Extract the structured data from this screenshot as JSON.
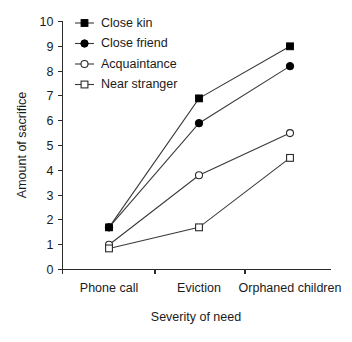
{
  "chart_data": {
    "type": "line",
    "title": "",
    "xlabel": "Severity of need",
    "ylabel": "Amount of sacrifice",
    "categories": [
      "Phone call",
      "Eviction",
      "Orphaned children"
    ],
    "ylim": [
      0,
      10
    ],
    "yticks": [
      0,
      1,
      2,
      3,
      4,
      5,
      6,
      7,
      8,
      9,
      10
    ],
    "grid": false,
    "legend_position": "top-left",
    "series": [
      {
        "name": "Close kin",
        "marker": "filled-square",
        "color": "#000000",
        "values": [
          1.7,
          6.9,
          9.0
        ]
      },
      {
        "name": "Close friend",
        "marker": "filled-circle",
        "color": "#000000",
        "values": [
          1.7,
          5.9,
          8.2
        ]
      },
      {
        "name": "Acquaintance",
        "marker": "open-circle",
        "color": "#2b2b2b",
        "values": [
          1.0,
          3.8,
          5.5
        ]
      },
      {
        "name": "Near stranger",
        "marker": "open-square",
        "color": "#2b2b2b",
        "values": [
          0.85,
          1.7,
          4.5
        ]
      }
    ]
  },
  "axes": {
    "y_tick_labels": [
      "0",
      "1",
      "2",
      "3",
      "4",
      "5",
      "6",
      "7",
      "8",
      "9",
      "10"
    ],
    "x_tick_labels": [
      "Phone call",
      "Eviction",
      "Orphaned children"
    ],
    "y_title": "Amount of sacrifice",
    "x_title": "Severity of need"
  },
  "legend": {
    "entries": [
      {
        "label": "Close kin",
        "marker": "filled-square"
      },
      {
        "label": "Close friend",
        "marker": "filled-circle"
      },
      {
        "label": "Acquaintance",
        "marker": "open-circle"
      },
      {
        "label": "Near stranger",
        "marker": "open-square"
      }
    ]
  }
}
